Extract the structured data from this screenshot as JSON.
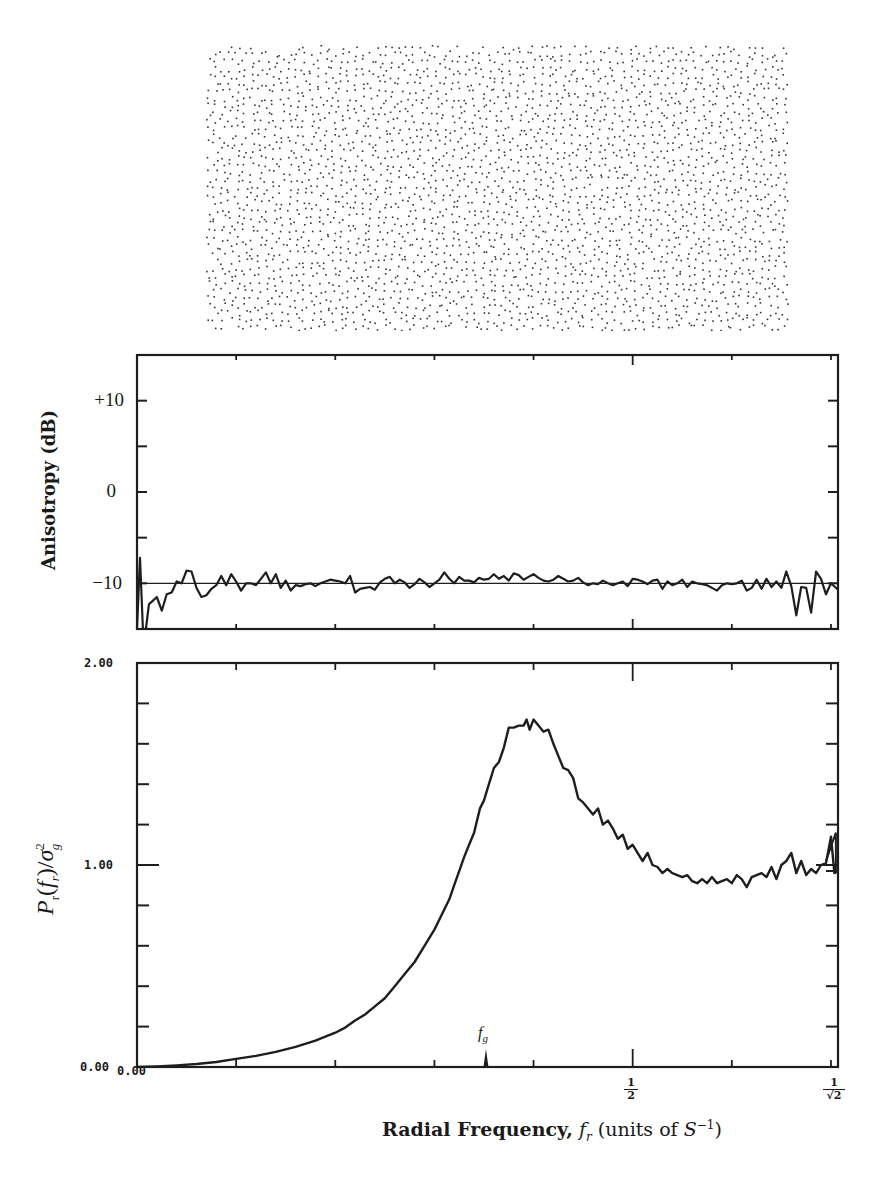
{
  "figure": {
    "dot_pattern": {
      "description": "blue-noise stipple pattern of black dots",
      "region": {
        "x": 205,
        "y": 44,
        "width": 586,
        "height": 287
      },
      "dot_color": "#333333"
    },
    "aniso_plot": {
      "ylabel": "Anisotropy (dB)",
      "yticks": [
        "+10",
        "0",
        "−10"
      ]
    },
    "power_plot": {
      "ylabel_main": "P",
      "ylabel_sub": "r",
      "ylabel_arg": "(f",
      "ylabel_arg_sub": "r",
      "ylabel_tail": ")/σ",
      "ylabel_sup": "2",
      "ylabel_sub2": "g",
      "ytick_top": "2.00",
      "ytick_mid": "1.00",
      "ytick_bottom": "0.00",
      "xtick_origin": "0.00",
      "fg_label": "f",
      "fg_sub": "g",
      "half_num": "1",
      "half_den": "2",
      "rt2_num": "1",
      "rt2_den": "√2"
    },
    "xlabel": {
      "bold": "Radial Frequency,",
      "italic_f": "f",
      "italic_sub": "r",
      "units_pre": "(units of ",
      "units_S": "S",
      "units_sup": "−1",
      "units_post": ")"
    }
  },
  "chart_data": [
    {
      "type": "line",
      "title": "",
      "xlabel": "Radial Frequency, f_r (units of S^-1)",
      "ylabel": "Anisotropy (dB)",
      "xlim": [
        0,
        0.7071
      ],
      "ylim": [
        -15,
        15
      ],
      "yticks": [
        10,
        0,
        -10
      ],
      "ytick_labels": [
        "+10",
        "0",
        "-10"
      ],
      "minor_yticks": [
        15,
        10,
        5,
        0,
        -5,
        -10,
        -15
      ],
      "xticks": [
        0,
        0.1,
        0.2,
        0.3,
        0.4,
        0.5,
        0.6,
        0.7
      ],
      "reference_line": -10,
      "grid": false,
      "series": [
        {
          "name": "anisotropy",
          "x": [
            0.0,
            0.003,
            0.006,
            0.009,
            0.012,
            0.015,
            0.02,
            0.025,
            0.03,
            0.035,
            0.04,
            0.045,
            0.05,
            0.055,
            0.06,
            0.065,
            0.07,
            0.075,
            0.08,
            0.085,
            0.09,
            0.095,
            0.1,
            0.105,
            0.11,
            0.115,
            0.12,
            0.125,
            0.13,
            0.135,
            0.14,
            0.145,
            0.15,
            0.155,
            0.16,
            0.165,
            0.17,
            0.175,
            0.18,
            0.185,
            0.19,
            0.195,
            0.2,
            0.205,
            0.21,
            0.215,
            0.22,
            0.225,
            0.23,
            0.235,
            0.24,
            0.245,
            0.25,
            0.255,
            0.26,
            0.265,
            0.27,
            0.275,
            0.28,
            0.285,
            0.29,
            0.295,
            0.3,
            0.305,
            0.31,
            0.315,
            0.32,
            0.325,
            0.33,
            0.335,
            0.34,
            0.345,
            0.35,
            0.355,
            0.36,
            0.365,
            0.37,
            0.375,
            0.38,
            0.385,
            0.39,
            0.395,
            0.4,
            0.405,
            0.41,
            0.415,
            0.42,
            0.425,
            0.43,
            0.435,
            0.44,
            0.445,
            0.45,
            0.455,
            0.46,
            0.465,
            0.47,
            0.475,
            0.48,
            0.485,
            0.49,
            0.495,
            0.5,
            0.505,
            0.51,
            0.515,
            0.52,
            0.525,
            0.53,
            0.535,
            0.54,
            0.545,
            0.55,
            0.555,
            0.56,
            0.565,
            0.57,
            0.575,
            0.58,
            0.585,
            0.59,
            0.595,
            0.6,
            0.605,
            0.61,
            0.615,
            0.62,
            0.625,
            0.63,
            0.635,
            0.64,
            0.645,
            0.65,
            0.655,
            0.66,
            0.665,
            0.67,
            0.675,
            0.68,
            0.685,
            0.69,
            0.695,
            0.7,
            0.7071
          ],
          "y": [
            -15,
            -7.2,
            -15,
            -15,
            -12.3,
            -12,
            -11.5,
            -13,
            -11.2,
            -11,
            -9.8,
            -10,
            -8.6,
            -8.7,
            -10.5,
            -11.5,
            -11.3,
            -10.6,
            -10.2,
            -9.2,
            -10.2,
            -9,
            -9.8,
            -10.8,
            -10,
            -10,
            -10.2,
            -9.5,
            -8.8,
            -10,
            -9,
            -10.5,
            -9.7,
            -10.8,
            -10.2,
            -10.3,
            -10.1,
            -10,
            -10.3,
            -10,
            -9.8,
            -9.6,
            -9.7,
            -9.8,
            -10,
            -9.2,
            -11,
            -10.6,
            -10.5,
            -10.4,
            -10.7,
            -9.9,
            -9.5,
            -9.3,
            -10,
            -9.6,
            -9.9,
            -10.5,
            -10.1,
            -9.5,
            -9.9,
            -10.4,
            -10,
            -9.6,
            -8.8,
            -9.5,
            -10,
            -9.3,
            -9.7,
            -9.7,
            -9.9,
            -9.4,
            -9.6,
            -9.5,
            -9.0,
            -9.5,
            -9.2,
            -9.7,
            -8.9,
            -9.1,
            -9.6,
            -9.3,
            -9.0,
            -9.4,
            -9.7,
            -9.8,
            -9.6,
            -9.2,
            -9.5,
            -9.8,
            -9.7,
            -9.4,
            -9.9,
            -10.2,
            -10.0,
            -10.1,
            -9.7,
            -10.0,
            -10.2,
            -10.0,
            -9.8,
            -10.3,
            -9.5,
            -9.6,
            -9.8,
            -10.1,
            -9.7,
            -9.6,
            -10.6,
            -9.8,
            -10.2,
            -10.0,
            -9.6,
            -10.4,
            -9.8,
            -10.0,
            -10.1,
            -10.2,
            -10.5,
            -10.8,
            -10.2,
            -10.0,
            -10.1,
            -10.0,
            -9.7,
            -10.8,
            -10.5,
            -9.6,
            -10.6,
            -9.5,
            -10.4,
            -9.8,
            -10.5,
            -8.7,
            -10.3,
            -13.5,
            -10.4,
            -10.5,
            -13.2,
            -8.7,
            -9.5,
            -11.2,
            -10,
            -10.7,
            -15
          ]
        }
      ]
    },
    {
      "type": "line",
      "title": "",
      "xlabel": "Radial Frequency, f_r (units of S^-1)",
      "ylabel": "P_r(f_r)/sigma_g^2",
      "xlim": [
        0,
        0.7071
      ],
      "ylim": [
        0,
        2
      ],
      "yticks": [
        0,
        1,
        2
      ],
      "ytick_labels": [
        "0.00",
        "1.00",
        "2.00"
      ],
      "minor_yticks": [
        0.2,
        0.4,
        0.6,
        0.8,
        1.2,
        1.4,
        1.6,
        1.8
      ],
      "xticks": [
        0,
        0.1,
        0.2,
        0.3,
        0.4,
        0.5,
        0.6,
        0.7
      ],
      "xtick_labels": {
        "0": "0.00",
        "0.5": "1/2",
        "0.7071": "1/√2"
      },
      "annotations": [
        {
          "label": "f_g",
          "x": 0.352,
          "type": "arrow-marker"
        }
      ],
      "reference_line": 1.0,
      "grid": false,
      "series": [
        {
          "name": "P_r(f_r)/sigma_g^2",
          "x": [
            0.0,
            0.02,
            0.04,
            0.06,
            0.08,
            0.1,
            0.12,
            0.14,
            0.16,
            0.18,
            0.2,
            0.21,
            0.22,
            0.23,
            0.24,
            0.25,
            0.26,
            0.27,
            0.28,
            0.29,
            0.3,
            0.305,
            0.31,
            0.315,
            0.32,
            0.325,
            0.33,
            0.335,
            0.34,
            0.343,
            0.346,
            0.35,
            0.355,
            0.36,
            0.365,
            0.37,
            0.375,
            0.38,
            0.385,
            0.39,
            0.393,
            0.396,
            0.4,
            0.405,
            0.41,
            0.415,
            0.42,
            0.425,
            0.43,
            0.435,
            0.44,
            0.445,
            0.45,
            0.455,
            0.46,
            0.465,
            0.47,
            0.475,
            0.48,
            0.485,
            0.49,
            0.495,
            0.5,
            0.505,
            0.51,
            0.515,
            0.52,
            0.525,
            0.53,
            0.535,
            0.54,
            0.545,
            0.55,
            0.555,
            0.56,
            0.565,
            0.57,
            0.575,
            0.58,
            0.585,
            0.59,
            0.595,
            0.6,
            0.605,
            0.61,
            0.615,
            0.62,
            0.625,
            0.63,
            0.635,
            0.64,
            0.645,
            0.65,
            0.655,
            0.66,
            0.665,
            0.67,
            0.675,
            0.68,
            0.685,
            0.69,
            0.695,
            0.7,
            0.7035,
            0.7071
          ],
          "y": [
            0.0,
            0.003,
            0.008,
            0.015,
            0.025,
            0.04,
            0.055,
            0.075,
            0.1,
            0.13,
            0.17,
            0.195,
            0.23,
            0.26,
            0.3,
            0.34,
            0.4,
            0.46,
            0.52,
            0.6,
            0.68,
            0.73,
            0.78,
            0.83,
            0.9,
            0.97,
            1.04,
            1.1,
            1.16,
            1.22,
            1.28,
            1.32,
            1.4,
            1.48,
            1.51,
            1.58,
            1.68,
            1.68,
            1.69,
            1.69,
            1.72,
            1.67,
            1.72,
            1.69,
            1.66,
            1.67,
            1.6,
            1.54,
            1.48,
            1.47,
            1.43,
            1.33,
            1.31,
            1.28,
            1.25,
            1.28,
            1.2,
            1.22,
            1.18,
            1.13,
            1.15,
            1.08,
            1.1,
            1.06,
            1.02,
            1.06,
            1.0,
            0.99,
            0.96,
            0.98,
            0.96,
            0.95,
            0.94,
            0.95,
            0.92,
            0.91,
            0.93,
            0.91,
            0.94,
            0.91,
            0.92,
            0.93,
            0.91,
            0.95,
            0.93,
            0.89,
            0.94,
            0.95,
            0.96,
            0.94,
            0.99,
            0.93,
            1.0,
            1.02,
            1.06,
            0.96,
            1.02,
            0.95,
            0.98,
            0.96,
            1.0,
            1.01,
            1.14,
            0.96,
            0.97
          ],
          "extra_segments": [
            {
              "x": [
                0.695,
                0.705,
                0.705,
                0.695
              ],
              "y": [
                1.02,
                1.16,
                0.97,
                0.97
              ]
            }
          ]
        }
      ]
    }
  ]
}
